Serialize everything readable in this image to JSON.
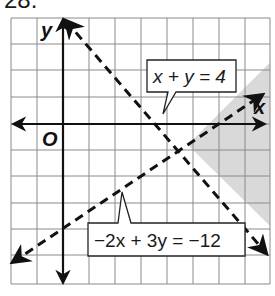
{
  "problem_number": "28.",
  "axes": {
    "x_label": "x",
    "y_label": "y",
    "origin_label": "O"
  },
  "grid": {
    "x_min": -2,
    "x_max": 8,
    "y_min": -6,
    "y_max": 4,
    "cell_px": 26
  },
  "lines": [
    {
      "equation": "x + y = 4",
      "style": "dashed",
      "label_text": "x + y = 4"
    },
    {
      "equation": "-2x + 3y = -12",
      "style": "dashed",
      "label_text": "−2x + 3y = −12"
    }
  ],
  "shaded_region": {
    "description": "x + y > 4 and -2x + 3y < -12",
    "color": "#d9d9d9"
  },
  "colors": {
    "grid": "#8a8a8a",
    "axis": "#111111",
    "line": "#111111",
    "shade": "#d9d9d9"
  }
}
